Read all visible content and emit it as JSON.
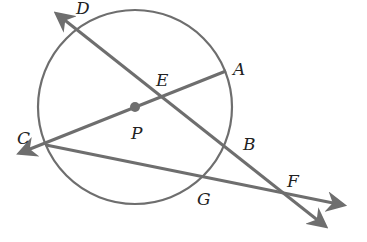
{
  "diagram": {
    "colors": {
      "stroke": "#6e6e6e",
      "label": "#222222",
      "background": "#ffffff"
    },
    "points": {
      "D": "D",
      "E": "E",
      "A": "A",
      "P": "P",
      "C": "C",
      "B": "B",
      "G": "G",
      "F": "F"
    },
    "elements": [
      {
        "type": "circle",
        "center": "P"
      },
      {
        "type": "ray",
        "from": "F",
        "through": "D",
        "label": "line DF"
      },
      {
        "type": "segment",
        "from": "C",
        "to": "A",
        "through": "P"
      },
      {
        "type": "ray",
        "from": "A",
        "through": "C"
      },
      {
        "type": "ray",
        "from": "C",
        "through": "F"
      },
      {
        "type": "point",
        "name": "P",
        "role": "center"
      }
    ]
  }
}
